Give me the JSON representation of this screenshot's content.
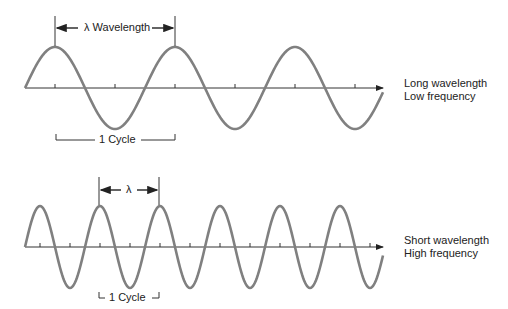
{
  "colors": {
    "wave": "#808080",
    "axis": "#333333",
    "text": "#222222"
  },
  "top_diagram": {
    "wavelength_label": "λ Wavelength",
    "cycle_label": "1 Cycle",
    "desc_line1": "Long wavelength",
    "desc_line2": "Low frequency",
    "wavelength_px": 120,
    "cycles_shown": 3
  },
  "bottom_diagram": {
    "wavelength_label": "λ",
    "cycle_label": "1 Cycle",
    "desc_line1": "Short wavelength",
    "desc_line2": "High frequency",
    "wavelength_px": 60,
    "cycles_shown": 6
  }
}
